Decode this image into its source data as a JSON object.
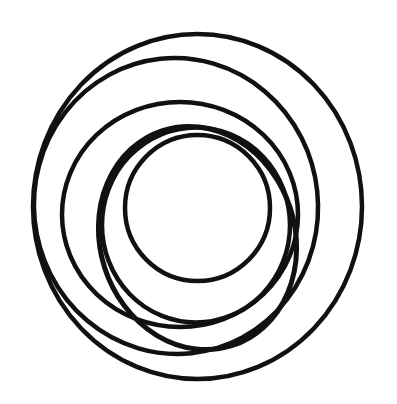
{
  "canvas": {
    "width": 397,
    "height": 404,
    "background": "#ffffff"
  },
  "figure": {
    "stroke_color": "#111111",
    "rings": [
      {
        "name": "ring-outermost",
        "cx": 197.5,
        "cy": 206.5,
        "rx": 164.5,
        "ry": 172.5,
        "rotate": 0,
        "stroke_width": 4.5
      },
      {
        "name": "ring-second",
        "cx": 176,
        "cy": 206,
        "rx": 142,
        "ry": 148,
        "rotate": -6,
        "stroke_width": 4.5
      },
      {
        "name": "ring-third",
        "cx": 180,
        "cy": 214.5,
        "rx": 118,
        "ry": 112.5,
        "rotate": 0,
        "stroke_width": 4.5
      },
      {
        "name": "ring-fourth",
        "cx": 197.5,
        "cy": 238,
        "rx": 97.5,
        "ry": 113,
        "rotate": -18,
        "stroke_width": 5
      },
      {
        "name": "ring-fifth",
        "cx": 196,
        "cy": 225,
        "rx": 94,
        "ry": 97.5,
        "rotate": 0,
        "stroke_width": 4.5
      },
      {
        "name": "ring-innermost",
        "cx": 197.5,
        "cy": 208,
        "rx": 72.5,
        "ry": 73,
        "rotate": 0,
        "stroke_width": 4.5
      }
    ]
  }
}
